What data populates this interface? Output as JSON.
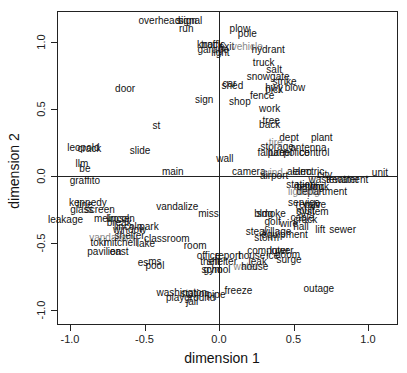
{
  "chart_data": {
    "type": "scatter",
    "title": "",
    "xlabel": "dimension 1",
    "ylabel": "dimension 2",
    "xlim": [
      -1.1,
      1.2
    ],
    "ylim": [
      -1.1,
      1.22
    ],
    "xticks": [
      -1.0,
      -0.5,
      0.0,
      0.5,
      1.0
    ],
    "yticks": [
      -1.0,
      -0.5,
      0.0,
      0.5,
      1.0
    ],
    "xtick_labels": [
      "-1.0",
      "-0.5",
      "0.0",
      "0.5",
      "1.0"
    ],
    "ytick_labels": [
      "-1.0",
      "-0.5",
      "0.0",
      "0.5",
      "1.0"
    ],
    "reference_lines": {
      "x": 0.0,
      "y": 0.0
    },
    "grid": false,
    "legend": null,
    "points": [
      {
        "label": "overhead",
        "x": -0.4,
        "y": 1.16
      },
      {
        "label": "signal",
        "x": -0.2,
        "y": 1.16
      },
      {
        "label": "sign",
        "x": -0.21,
        "y": 1.16
      },
      {
        "label": "run",
        "x": -0.22,
        "y": 1.1
      },
      {
        "label": "plow",
        "x": 0.14,
        "y": 1.1
      },
      {
        "label": "pole",
        "x": 0.19,
        "y": 1.06
      },
      {
        "label": "knock",
        "x": -0.06,
        "y": 0.98
      },
      {
        "label": "traffic",
        "x": -0.04,
        "y": 0.98
      },
      {
        "label": "exit",
        "x": 0.05,
        "y": 0.96
      },
      {
        "label": "garage",
        "x": -0.04,
        "y": 0.94
      },
      {
        "label": "light",
        "x": 0.01,
        "y": 0.92
      },
      {
        "label": "vehicle",
        "x": 0.19,
        "y": 0.96,
        "color": "gray"
      },
      {
        "label": "hydrant",
        "x": 0.33,
        "y": 0.94
      },
      {
        "label": "truck",
        "x": 0.3,
        "y": 0.84
      },
      {
        "label": "salt",
        "x": 0.37,
        "y": 0.79
      },
      {
        "label": "snowgate",
        "x": 0.33,
        "y": 0.74
      },
      {
        "label": "strike",
        "x": 0.44,
        "y": 0.7
      },
      {
        "label": "blow",
        "x": 0.51,
        "y": 0.66
      },
      {
        "label": "hwy",
        "x": 0.37,
        "y": 0.66
      },
      {
        "label": "pick",
        "x": 0.37,
        "y": 0.64
      },
      {
        "label": "fence",
        "x": 0.29,
        "y": 0.6
      },
      {
        "label": "door",
        "x": -0.63,
        "y": 0.65
      },
      {
        "label": "car",
        "x": 0.07,
        "y": 0.69
      },
      {
        "label": "shed",
        "x": 0.09,
        "y": 0.67
      },
      {
        "label": "sign",
        "x": -0.1,
        "y": 0.57
      },
      {
        "label": "shop",
        "x": 0.14,
        "y": 0.55
      },
      {
        "label": "work",
        "x": 0.34,
        "y": 0.5
      },
      {
        "label": "tree",
        "x": 0.35,
        "y": 0.41
      },
      {
        "label": "back",
        "x": 0.34,
        "y": 0.38
      },
      {
        "label": "st",
        "x": -0.42,
        "y": 0.37
      },
      {
        "label": "dept",
        "x": 0.47,
        "y": 0.28
      },
      {
        "label": "plant",
        "x": 0.69,
        "y": 0.28
      },
      {
        "label": "storage",
        "x": 0.39,
        "y": 0.22
      },
      {
        "label": "tire",
        "x": 0.38,
        "y": 0.25,
        "color": "gray"
      },
      {
        "label": "antenna",
        "x": 0.6,
        "y": 0.21
      },
      {
        "label": "failure",
        "x": 0.35,
        "y": 0.17
      },
      {
        "label": "panel",
        "x": 0.41,
        "y": 0.17
      },
      {
        "label": "police",
        "x": 0.52,
        "y": 0.17
      },
      {
        "label": "control",
        "x": 0.64,
        "y": 0.17
      },
      {
        "label": "leopold",
        "x": -0.91,
        "y": 0.21
      },
      {
        "label": "crack",
        "x": -0.87,
        "y": 0.2
      },
      {
        "label": "slide",
        "x": -0.53,
        "y": 0.19
      },
      {
        "label": "wall",
        "x": 0.04,
        "y": 0.13
      },
      {
        "label": "llm",
        "x": -0.92,
        "y": 0.09
      },
      {
        "label": "be",
        "x": -0.9,
        "y": 0.05
      },
      {
        "label": "main",
        "x": -0.31,
        "y": 0.03
      },
      {
        "label": "camera",
        "x": 0.2,
        "y": 0.03
      },
      {
        "label": "wind",
        "x": 0.36,
        "y": 0.02,
        "color": "gray"
      },
      {
        "label": "airport",
        "x": 0.37,
        "y": 0.0
      },
      {
        "label": "alarm",
        "x": 0.54,
        "y": 0.03
      },
      {
        "label": "electric",
        "x": 0.6,
        "y": 0.03
      },
      {
        "label": "city",
        "x": 0.71,
        "y": 0.01
      },
      {
        "label": "unit",
        "x": 1.08,
        "y": 0.02
      },
      {
        "label": "wastewater",
        "x": 0.77,
        "y": -0.03
      },
      {
        "label": "treatment",
        "x": 0.86,
        "y": -0.03
      },
      {
        "label": "graffito",
        "x": -0.9,
        "y": -0.04
      },
      {
        "label": "station",
        "x": 0.55,
        "y": -0.07
      },
      {
        "label": "batch",
        "x": 0.6,
        "y": -0.08
      },
      {
        "label": "network",
        "x": 0.62,
        "y": -0.08
      },
      {
        "label": "log",
        "x": 0.66,
        "y": -0.08
      },
      {
        "label": "lighting",
        "x": 0.57,
        "y": -0.12,
        "color": "gray"
      },
      {
        "label": "department",
        "x": 0.69,
        "y": -0.12
      },
      {
        "label": "kennedy",
        "x": -0.88,
        "y": -0.2
      },
      {
        "label": "line",
        "x": -0.9,
        "y": -0.22
      },
      {
        "label": "glass",
        "x": -0.92,
        "y": -0.25
      },
      {
        "label": "screen",
        "x": -0.8,
        "y": -0.25
      },
      {
        "label": "vandalize",
        "x": -0.28,
        "y": -0.23
      },
      {
        "label": "service",
        "x": 0.57,
        "y": -0.2
      },
      {
        "label": "repair",
        "x": 0.6,
        "y": -0.22
      },
      {
        "label": "valve",
        "x": 0.64,
        "y": -0.22
      },
      {
        "label": "mult",
        "x": 0.58,
        "y": -0.26
      },
      {
        "label": "system",
        "x": 0.63,
        "y": -0.27
      },
      {
        "label": "miss",
        "x": -0.07,
        "y": -0.28
      },
      {
        "label": "bldg",
        "x": 0.3,
        "y": -0.28
      },
      {
        "label": "smoke",
        "x": 0.35,
        "y": -0.28
      },
      {
        "label": "leakage",
        "x": -1.03,
        "y": -0.33
      },
      {
        "label": "melrose",
        "x": -0.72,
        "y": -0.32
      },
      {
        "label": "lincoln",
        "x": -0.66,
        "y": -0.32
      },
      {
        "label": "break",
        "x": -0.67,
        "y": -0.35
      },
      {
        "label": "cable",
        "x": 0.56,
        "y": -0.31
      },
      {
        "label": "crack",
        "x": 0.58,
        "y": -0.33
      },
      {
        "label": "golf",
        "x": 0.36,
        "y": -0.34
      },
      {
        "label": "wire",
        "x": 0.47,
        "y": -0.36
      },
      {
        "label": "hall",
        "x": 0.55,
        "y": -0.38
      },
      {
        "label": "lift",
        "x": 0.68,
        "y": -0.4
      },
      {
        "label": "sewer",
        "x": 0.83,
        "y": -0.4
      },
      {
        "label": "park",
        "x": -0.47,
        "y": -0.38
      },
      {
        "label": "lincoln",
        "x": -0.61,
        "y": -0.38
      },
      {
        "label": "window",
        "x": -0.6,
        "y": -0.4
      },
      {
        "label": "vandalism",
        "x": -0.72,
        "y": -0.46,
        "color": "gray"
      },
      {
        "label": "shelter",
        "x": -0.6,
        "y": -0.45
      },
      {
        "label": "classroom",
        "x": -0.35,
        "y": -0.47
      },
      {
        "label": "village",
        "x": 0.39,
        "y": -0.42
      },
      {
        "label": "equipment",
        "x": 0.44,
        "y": -0.44
      },
      {
        "label": "steal",
        "x": 0.25,
        "y": -0.42
      },
      {
        "label": "storm",
        "x": 0.32,
        "y": -0.46
      },
      {
        "label": "toki",
        "x": -0.81,
        "y": -0.5
      },
      {
        "label": "mitchell",
        "x": -0.66,
        "y": -0.5
      },
      {
        "label": "lake",
        "x": -0.49,
        "y": -0.51
      },
      {
        "label": "room",
        "x": -0.16,
        "y": -0.52
      },
      {
        "label": "pavilion",
        "x": -0.77,
        "y": -0.57
      },
      {
        "label": "east",
        "x": -0.67,
        "y": -0.57
      },
      {
        "label": "computer",
        "x": 0.33,
        "y": -0.56
      },
      {
        "label": "lower",
        "x": 0.42,
        "y": -0.56
      },
      {
        "label": "boom",
        "x": 0.46,
        "y": -0.59
      },
      {
        "label": "office",
        "x": -0.07,
        "y": -0.6
      },
      {
        "label": "report",
        "x": 0.06,
        "y": -0.6
      },
      {
        "label": "house",
        "x": 0.22,
        "y": -0.6
      },
      {
        "label": "ice",
        "x": 0.36,
        "y": -0.6
      },
      {
        "label": "surge",
        "x": 0.47,
        "y": -0.63
      },
      {
        "label": "leak",
        "x": 0.26,
        "y": -0.64
      },
      {
        "label": "es",
        "x": -0.51,
        "y": -0.65
      },
      {
        "label": "ms",
        "x": -0.43,
        "y": -0.64
      },
      {
        "label": "pool",
        "x": -0.43,
        "y": -0.67
      },
      {
        "label": "theft",
        "x": -0.06,
        "y": -0.64
      },
      {
        "label": "shelter",
        "x": 0.02,
        "y": -0.64
      },
      {
        "label": "water",
        "x": 0.18,
        "y": -0.68,
        "color": "gray"
      },
      {
        "label": "house",
        "x": 0.24,
        "y": -0.68
      },
      {
        "label": "gym",
        "x": -0.04,
        "y": -0.7
      },
      {
        "label": "school",
        "x": -0.02,
        "y": -0.7
      },
      {
        "label": "outage",
        "x": 0.67,
        "y": -0.84
      },
      {
        "label": "freeze",
        "x": 0.13,
        "y": -0.86
      },
      {
        "label": "washington",
        "x": -0.25,
        "y": -0.87
      },
      {
        "label": "station",
        "x": -0.16,
        "y": -0.88
      },
      {
        "label": "pipe",
        "x": -0.02,
        "y": -0.89
      },
      {
        "label": "playground",
        "x": -0.19,
        "y": -0.91
      },
      {
        "label": "jail",
        "x": -0.18,
        "y": -0.94
      }
    ]
  }
}
